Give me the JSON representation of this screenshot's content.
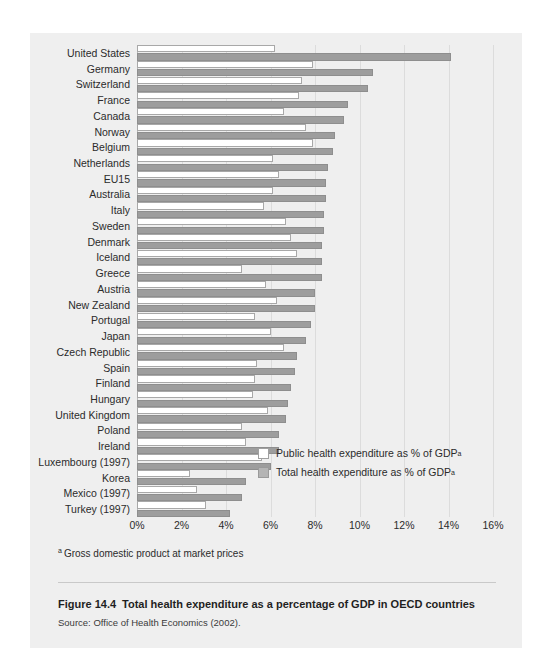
{
  "figure": {
    "number": "Figure 14.4",
    "title": "Total health expenditure as a percentage of GDP in OECD countries",
    "source": "Source: Office of Health Economics (2002).",
    "footnote_marker": "a",
    "footnote_text": "Gross domestic product at market prices"
  },
  "legend": {
    "public_label": "Public health expenditure as % of GDP",
    "total_label": "Total health expenditure as % of GDP",
    "superscript": "a",
    "public_color": "#ffffff",
    "total_color": "#9d9d9d"
  },
  "chart_data": {
    "type": "bar",
    "orientation": "horizontal",
    "title": "Total health expenditure as a percentage of GDP in OECD countries",
    "xlabel": "",
    "ylabel": "",
    "xlim": [
      0,
      16
    ],
    "xtick_labels": [
      "0%",
      "2%",
      "4%",
      "6%",
      "8%",
      "10%",
      "12%",
      "14%",
      "16%"
    ],
    "xticks": [
      0,
      2,
      4,
      6,
      8,
      10,
      12,
      14,
      16
    ],
    "grid": true,
    "legend_position": "inside-lower-right",
    "categories": [
      "United States",
      "Germany",
      "Switzerland",
      "France",
      "Canada",
      "Norway",
      "Belgium",
      "Netherlands",
      "EU15",
      "Australia",
      "Italy",
      "Sweden",
      "Denmark",
      "Iceland",
      "Greece",
      "Austria",
      "New Zealand",
      "Portugal",
      "Japan",
      "Czech Republic",
      "Spain",
      "Finland",
      "Hungary",
      "United Kingdom",
      "Poland",
      "Ireland",
      "Luxembourg (1997)",
      "Korea",
      "Mexico (1997)",
      "Turkey (1997)"
    ],
    "series": [
      {
        "name": "Public health expenditure as % of GDP",
        "values": [
          6.2,
          7.9,
          7.4,
          7.3,
          6.6,
          7.6,
          7.9,
          6.1,
          6.4,
          6.1,
          5.7,
          6.7,
          6.9,
          7.2,
          4.7,
          5.8,
          6.3,
          5.3,
          6.0,
          6.6,
          5.4,
          5.3,
          5.2,
          5.9,
          4.7,
          4.9,
          5.6,
          2.4,
          2.7,
          3.1
        ]
      },
      {
        "name": "Total health expenditure as % of GDP",
        "values": [
          14.1,
          10.6,
          10.4,
          9.5,
          9.3,
          8.9,
          8.8,
          8.6,
          8.5,
          8.5,
          8.4,
          8.4,
          8.3,
          8.3,
          8.3,
          8.0,
          8.0,
          7.8,
          7.6,
          7.2,
          7.1,
          6.9,
          6.8,
          6.7,
          6.4,
          6.4,
          6.0,
          4.9,
          4.7,
          4.2
        ]
      }
    ]
  }
}
